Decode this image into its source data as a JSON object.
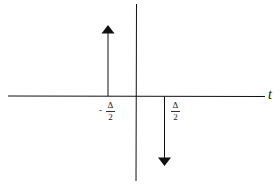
{
  "diagram": {
    "type": "impulse-pair",
    "axis_label": "t",
    "impulses": [
      {
        "position_label": {
          "sign": "-",
          "numerator": "Δ",
          "denominator": "2"
        },
        "direction": "up"
      },
      {
        "position_label": {
          "sign": "",
          "numerator": "Δ",
          "denominator": "2"
        },
        "direction": "down"
      }
    ],
    "colors": {
      "stroke": "#111111",
      "background": "#ffffff"
    }
  }
}
